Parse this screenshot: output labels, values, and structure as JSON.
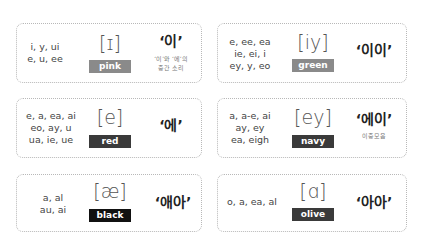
{
  "cards": [
    {
      "spellings": [
        "i, y, ui",
        "e, u, ee"
      ],
      "ipa": "[ɪ]",
      "color_name": "pink",
      "badge_color": "#8a8a8a",
      "korean": "‘이’",
      "note": [
        "‘이’와 ‘에’의",
        "중간 소리"
      ]
    },
    {
      "spellings": [
        "e, ee, ea",
        "ie, ei, i",
        "ey, y, eo"
      ],
      "ipa": "[iy]",
      "color_name": "green",
      "badge_color": "#8a8a8a",
      "korean": "‘이이’",
      "note": []
    },
    {
      "spellings": [
        "e, a, ea, ai",
        "eo, ay, u",
        "ua, ie, ue"
      ],
      "ipa": "[e]",
      "color_name": "red",
      "badge_color": "#3a3a3a",
      "korean": "‘에’",
      "note": []
    },
    {
      "spellings": [
        "a, a-e, ai",
        "ay, ey",
        "ea, eigh"
      ],
      "ipa": "[ey]",
      "color_name": "navy",
      "badge_color": "#3a3a3a",
      "korean": "‘에이’",
      "note": [
        "이중모음"
      ]
    },
    {
      "spellings": [
        "a, al",
        "au, ai"
      ],
      "ipa": "[æ]",
      "color_name": "black",
      "badge_color": "#111111",
      "korean": "‘애아’",
      "note": []
    },
    {
      "spellings": [
        "o, a, ea, al"
      ],
      "ipa": "[ɑ]",
      "color_name": "olive",
      "badge_color": "#3a3a3a",
      "korean": "‘아아’",
      "note": []
    }
  ]
}
